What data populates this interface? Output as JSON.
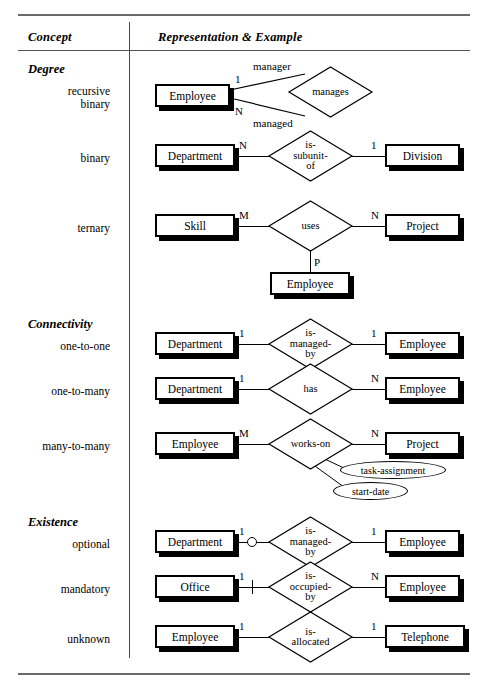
{
  "table": {
    "columns": {
      "concept": "Concept",
      "representation": "Representation & Example"
    },
    "sections": [
      {
        "heading": "Degree",
        "rows": [
          {
            "label_lines": [
              "recursive",
              "binary"
            ],
            "diagram": {
              "entities": [
                "Employee"
              ],
              "relationship": "manages",
              "cardinalities": [
                "1",
                "N"
              ],
              "role_labels": [
                "manager",
                "managed"
              ]
            }
          },
          {
            "label_lines": [
              "binary"
            ],
            "diagram": {
              "entities": [
                "Department",
                "Division"
              ],
              "relationship": "is-subunit-of",
              "relationship_lines": [
                "is-",
                "subunit-",
                "of"
              ],
              "cardinalities": [
                "N",
                "1"
              ]
            }
          },
          {
            "label_lines": [
              "ternary"
            ],
            "diagram": {
              "entities": [
                "Skill",
                "Project",
                "Employee"
              ],
              "relationship": "uses",
              "relationship_lines": [
                "uses"
              ],
              "cardinalities": [
                "M",
                "N",
                "P"
              ]
            }
          }
        ]
      },
      {
        "heading": "Connectivity",
        "rows": [
          {
            "label_lines": [
              "one-to-one"
            ],
            "diagram": {
              "entities": [
                "Department",
                "Employee"
              ],
              "relationship": "is-managed-by",
              "relationship_lines": [
                "is-",
                "managed-",
                "by"
              ],
              "cardinalities": [
                "1",
                "1"
              ]
            }
          },
          {
            "label_lines": [
              "one-to-many"
            ],
            "diagram": {
              "entities": [
                "Department",
                "Employee"
              ],
              "relationship": "has",
              "relationship_lines": [
                "has"
              ],
              "cardinalities": [
                "1",
                "N"
              ]
            }
          },
          {
            "label_lines": [
              "many-to-many"
            ],
            "diagram": {
              "entities": [
                "Employee",
                "Project"
              ],
              "relationship": "works-on",
              "relationship_lines": [
                "works-on"
              ],
              "cardinalities": [
                "M",
                "N"
              ],
              "attributes": [
                "task-assignment",
                "start-date"
              ]
            }
          }
        ]
      },
      {
        "heading": "Existence",
        "rows": [
          {
            "label_lines": [
              "optional"
            ],
            "diagram": {
              "entities": [
                "Department",
                "Employee"
              ],
              "relationship": "is-managed-by",
              "relationship_lines": [
                "is-",
                "managed-",
                "by"
              ],
              "cardinalities": [
                "1",
                "1"
              ],
              "marker": "circle"
            }
          },
          {
            "label_lines": [
              "mandatory"
            ],
            "diagram": {
              "entities": [
                "Office",
                "Employee"
              ],
              "relationship": "is-occupied-by",
              "relationship_lines": [
                "is-",
                "occupied-",
                "by"
              ],
              "cardinalities": [
                "1",
                "N"
              ],
              "marker": "tick"
            }
          },
          {
            "label_lines": [
              "unknown"
            ],
            "diagram": {
              "entities": [
                "Employee",
                "Telephone"
              ],
              "relationship": "is-allocated",
              "relationship_lines": [
                "is-",
                "allocated"
              ],
              "cardinalities": [
                "1",
                "1"
              ]
            }
          }
        ]
      }
    ]
  },
  "colors": {
    "ink": "#000000",
    "rule": "#585858",
    "page": "#ffffff"
  }
}
